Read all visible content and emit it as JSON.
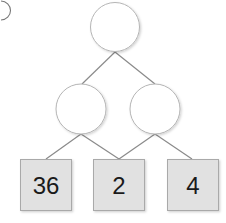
{
  "diagram": {
    "type": "tree",
    "corner_marker": "partial-circled-label",
    "colors": {
      "edge": "#8a8a8a",
      "circle_stroke": "#b5b5b5",
      "circle_fill": "#ffffff",
      "box_fill": "#e1e1e1",
      "box_stroke": "#a9a9a9",
      "text": "#1a1a1a"
    },
    "nodes": [
      {
        "id": "top",
        "kind": "circle",
        "label": ""
      },
      {
        "id": "mid-left",
        "kind": "circle",
        "label": ""
      },
      {
        "id": "mid-right",
        "kind": "circle",
        "label": ""
      },
      {
        "id": "leaf-1",
        "kind": "box",
        "label": "36"
      },
      {
        "id": "leaf-2",
        "kind": "box",
        "label": "2"
      },
      {
        "id": "leaf-3",
        "kind": "box",
        "label": "4"
      }
    ],
    "edges": [
      [
        "top",
        "mid-left"
      ],
      [
        "top",
        "mid-right"
      ],
      [
        "mid-left",
        "leaf-1"
      ],
      [
        "mid-left",
        "leaf-2"
      ],
      [
        "mid-right",
        "leaf-2"
      ],
      [
        "mid-right",
        "leaf-3"
      ]
    ]
  }
}
